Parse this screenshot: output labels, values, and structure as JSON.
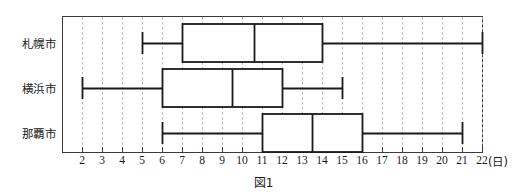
{
  "figure": {
    "caption": "図1",
    "unit_label": "(日)",
    "axis_color": "#3a3a3a",
    "grid_color": "#b9b9b9",
    "series_color": "#1a1a1a"
  },
  "chart_data": {
    "type": "box",
    "title": "図1",
    "xlabel": "(日)",
    "ylabel": "",
    "xlim": [
      1.0,
      23.0
    ],
    "grid": true,
    "grid_axis": "x",
    "legend": "none",
    "categories": [
      "札幌市",
      "横浜市",
      "那覇市"
    ],
    "tick_labels": [
      "2",
      "3",
      "4",
      "5",
      "6",
      "7",
      "8",
      "9",
      "10",
      "11",
      "12",
      "13",
      "14",
      "15",
      "16",
      "17",
      "18",
      "19",
      "20",
      "21",
      "22"
    ],
    "tick_values": [
      2,
      3,
      4,
      5,
      6,
      7,
      8,
      9,
      10,
      11,
      12,
      13,
      14,
      15,
      16,
      17,
      18,
      19,
      20,
      21,
      22
    ],
    "series": [
      {
        "name": "札幌市",
        "min": 5,
        "q1": 7,
        "median": 10.6,
        "q3": 14,
        "max": 22
      },
      {
        "name": "横浜市",
        "min": 2,
        "q1": 6,
        "median": 9.5,
        "q3": 12,
        "max": 15
      },
      {
        "name": "那覇市",
        "min": 6,
        "q1": 11,
        "median": 13.5,
        "q3": 16,
        "max": 21
      }
    ]
  }
}
